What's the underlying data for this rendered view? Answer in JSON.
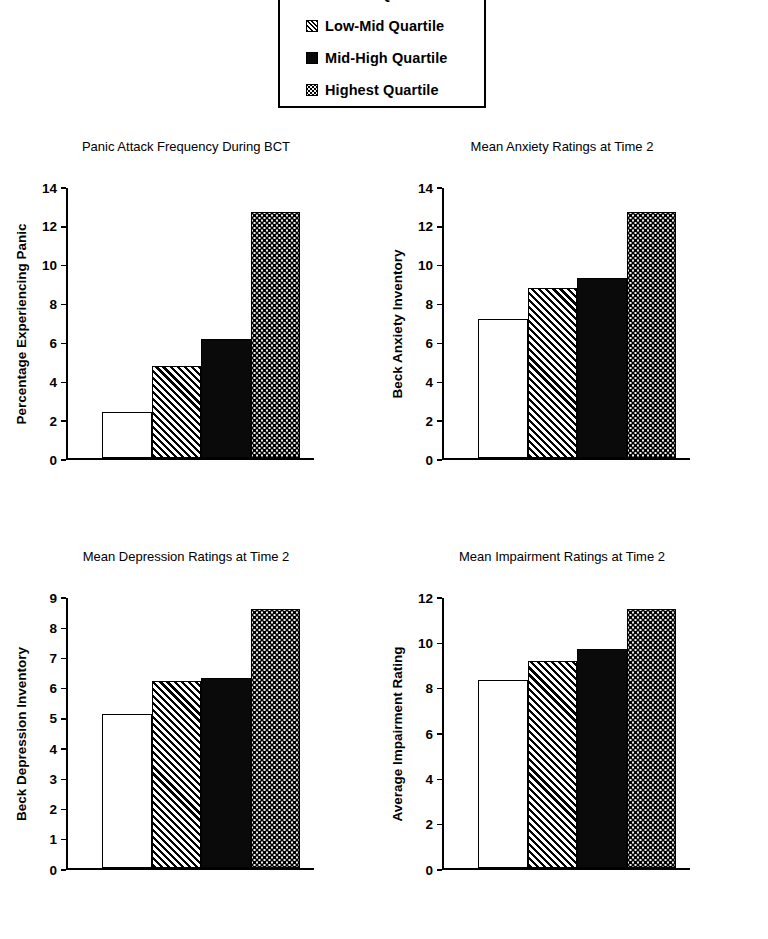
{
  "legend": {
    "name": "quartile-legend",
    "items": [
      {
        "label": "Lowest Quartile",
        "pattern": "white"
      },
      {
        "label": "Low-Mid Quartile",
        "pattern": "hatch"
      },
      {
        "label": "Mid-High Quartile",
        "pattern": "solid"
      },
      {
        "label": "Highest Quartile",
        "pattern": "dots"
      }
    ]
  },
  "colors": {
    "ink": "#000000",
    "background": "#ffffff",
    "solid_bar": "#0a0a0a",
    "dotted_bar_base": "#f0f0f0"
  },
  "chart_data": [
    {
      "type": "bar",
      "title": "Panic Attack Frequency During BCT",
      "xlabel": "",
      "ylabel": "Percentage Experiencing Panic",
      "categories": [
        "Lowest Quartile",
        "Low-Mid Quartile",
        "Mid-High Quartile",
        "Highest Quartile"
      ],
      "values": [
        2.4,
        4.8,
        6.2,
        12.75
      ],
      "ylim": [
        0,
        14
      ],
      "yticks": [
        0,
        2,
        4,
        6,
        8,
        10,
        12,
        14
      ],
      "grid": false,
      "legend_position": "top-center"
    },
    {
      "type": "bar",
      "title": "Mean Anxiety Ratings at Time 2",
      "xlabel": "",
      "ylabel": "Beck Anxiety Inventory",
      "categories": [
        "Lowest Quartile",
        "Low-Mid Quartile",
        "Mid-High Quartile",
        "Highest Quartile"
      ],
      "values": [
        7.2,
        8.8,
        9.35,
        12.75
      ],
      "ylim": [
        0,
        14
      ],
      "yticks": [
        0,
        2,
        4,
        6,
        8,
        10,
        12,
        14
      ],
      "grid": false,
      "legend_position": "top-center"
    },
    {
      "type": "bar",
      "title": "Mean Depression Ratings at Time 2",
      "xlabel": "",
      "ylabel": "Beck Depression Inventory",
      "categories": [
        "Lowest Quartile",
        "Low-Mid Quartile",
        "Mid-High Quartile",
        "Highest Quartile"
      ],
      "values": [
        5.15,
        6.25,
        6.35,
        8.65
      ],
      "ylim": [
        0,
        9
      ],
      "yticks": [
        0,
        1,
        2,
        3,
        4,
        5,
        6,
        7,
        8,
        9
      ],
      "grid": false,
      "legend_position": "top-center"
    },
    {
      "type": "bar",
      "title": "Mean Impairment Ratings at Time 2",
      "xlabel": "",
      "ylabel": "Average Impairment Rating",
      "categories": [
        "Lowest Quartile",
        "Low-Mid Quartile",
        "Mid-High Quartile",
        "Highest Quartile"
      ],
      "values": [
        8.35,
        9.2,
        9.75,
        11.5
      ],
      "ylim": [
        0,
        12
      ],
      "yticks": [
        0,
        2,
        4,
        6,
        8,
        10,
        12
      ],
      "grid": false,
      "legend_position": "top-center"
    }
  ]
}
